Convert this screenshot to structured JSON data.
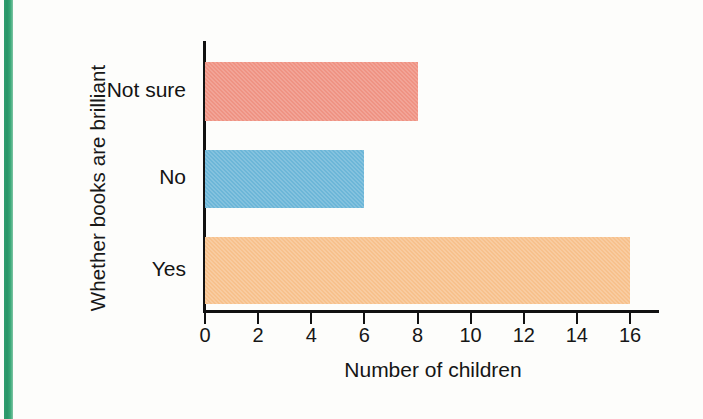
{
  "accents": {
    "spine_green": "#2f9e6e",
    "bar_salmon": "#ef9383",
    "bar_blue": "#6cb6d8",
    "bar_orange": "#f7c18c",
    "axis_black": "#111111"
  },
  "chart_data": {
    "type": "bar",
    "orientation": "horizontal",
    "title": "",
    "xlabel": "Number of children",
    "ylabel": "Whether books are brilliant",
    "categories": [
      "Not sure",
      "No",
      "Yes"
    ],
    "values": [
      8,
      6,
      16
    ],
    "bar_colors": [
      "#ef9383",
      "#6cb6d8",
      "#f7c18c"
    ],
    "xlim": [
      0,
      16
    ],
    "xticks": [
      0,
      2,
      4,
      6,
      8,
      10,
      12,
      14,
      16
    ],
    "xtick_labels": [
      "0",
      "2",
      "4",
      "6",
      "8",
      "10",
      "12",
      "14",
      "16"
    ],
    "grid": false,
    "legend": false
  }
}
